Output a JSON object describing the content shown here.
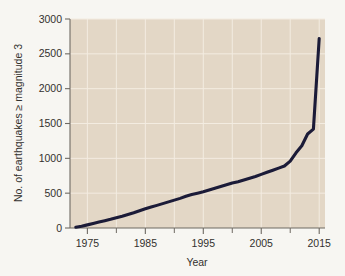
{
  "figure": {
    "background_color": "#f7f6f2",
    "plot_background_color": "#e3d7c6",
    "gridline_color": "#f3ece1",
    "line_color": "#1b1b38",
    "axis_color": "#6f6a63",
    "text_color": "#33312e"
  },
  "chart_data": {
    "type": "line",
    "title": "",
    "xlabel": "Year",
    "ylabel": "No. of earthquakes ≥ magnitude 3",
    "xlim": [
      1972,
      2016
    ],
    "ylim": [
      0,
      3000
    ],
    "grid": true,
    "legend": "none",
    "x_ticks": [
      1975,
      1985,
      1995,
      2005,
      2015
    ],
    "x_tick_labels": [
      "1975",
      "1985",
      "1995",
      "2005",
      "2015"
    ],
    "x_minor_ticks": [
      1980,
      1990,
      2000,
      2010
    ],
    "y_ticks": [
      0,
      500,
      1000,
      1500,
      2000,
      2500,
      3000
    ],
    "y_tick_labels": [
      "0",
      "500",
      "1000",
      "1500",
      "2000",
      "2500",
      "3000"
    ],
    "series": [
      {
        "name": "Cumulative earthquakes ≥ magnitude 3",
        "color": "#1b1b38",
        "x": [
          1973,
          1974,
          1975,
          1976,
          1977,
          1978,
          1979,
          1980,
          1981,
          1982,
          1983,
          1984,
          1985,
          1986,
          1987,
          1988,
          1989,
          1990,
          1991,
          1992,
          1993,
          1994,
          1995,
          1996,
          1997,
          1998,
          1999,
          2000,
          2001,
          2002,
          2003,
          2004,
          2005,
          2006,
          2007,
          2008,
          2009,
          2010,
          2011,
          2012,
          2013,
          2014,
          2015
        ],
        "values": [
          10,
          25,
          45,
          65,
          85,
          105,
          125,
          148,
          170,
          195,
          220,
          248,
          275,
          300,
          325,
          350,
          375,
          400,
          425,
          455,
          480,
          500,
          520,
          545,
          570,
          595,
          620,
          645,
          665,
          690,
          715,
          740,
          770,
          800,
          830,
          860,
          890,
          960,
          1080,
          1180,
          1350,
          1420,
          2720
        ]
      }
    ]
  },
  "axis_labels": {
    "x_title": "Year",
    "y_title": "No. of earthquakes ≥ magnitude 3"
  }
}
